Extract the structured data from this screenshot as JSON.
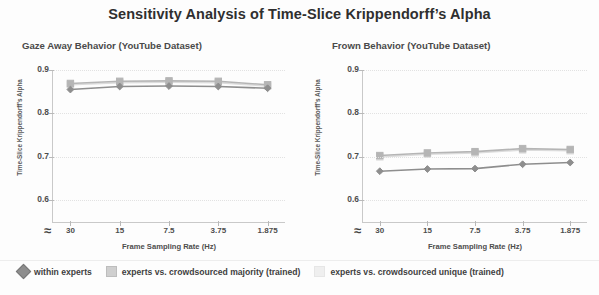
{
  "chart_data": {
    "type": "line",
    "title": "Sensitivity Analysis of Time-Slice Krippendorff’s Alpha",
    "xlabel": "Frame Sampling Rate (Hz)",
    "ylabel": "Time-Slice Krippendorff's Alpha",
    "categories": [
      "30",
      "15",
      "7.5",
      "3.75",
      "1.875"
    ],
    "ylim": [
      0.55,
      0.9
    ],
    "yticks": [
      "0.9",
      "0.8",
      "0.7",
      "0.6"
    ],
    "ytick_values": [
      0.9,
      0.8,
      0.7,
      0.6
    ],
    "grid": true,
    "axis_break_symbol": "≈",
    "legend_position": "bottom",
    "panels": [
      {
        "title": "Gaze Away Behavior (YouTube Dataset)",
        "series": [
          {
            "name": "within experts",
            "marker": "diamond",
            "color": "#8e8e8e",
            "values": [
              0.855,
              0.862,
              0.863,
              0.862,
              0.858
            ]
          },
          {
            "name": "experts vs. crowdsourced majority (trained)",
            "marker": "square",
            "color": "#b5b5b5",
            "values": [
              0.869,
              0.874,
              0.875,
              0.874,
              0.866
            ]
          },
          {
            "name": "experts vs. crowdsourced unique (trained)",
            "marker": "square",
            "color": "#dcdcdc",
            "values": [
              0.866,
              0.871,
              0.872,
              0.871,
              0.863
            ]
          }
        ]
      },
      {
        "title": "Frown Behavior (YouTube Dataset)",
        "series": [
          {
            "name": "within experts",
            "marker": "diamond",
            "color": "#8e8e8e",
            "values": [
              0.667,
              0.672,
              0.673,
              0.683,
              0.687
            ]
          },
          {
            "name": "experts vs. crowdsourced majority (trained)",
            "marker": "square",
            "color": "#b5b5b5",
            "values": [
              0.703,
              0.709,
              0.712,
              0.719,
              0.717
            ]
          },
          {
            "name": "experts vs. crowdsourced unique (trained)",
            "marker": "square",
            "color": "#dcdcdc",
            "values": [
              0.7,
              0.706,
              0.709,
              0.716,
              0.714
            ]
          }
        ]
      }
    ],
    "legend": [
      {
        "label": "within experts",
        "marker": "diamond",
        "color": "#8e8e8e"
      },
      {
        "label": "experts vs. crowdsourced majority (trained)",
        "marker": "square",
        "color": "#cfcfcf"
      },
      {
        "label": "experts vs. crowdsourced unique (trained)",
        "marker": "square",
        "color": "#efefef"
      }
    ]
  }
}
